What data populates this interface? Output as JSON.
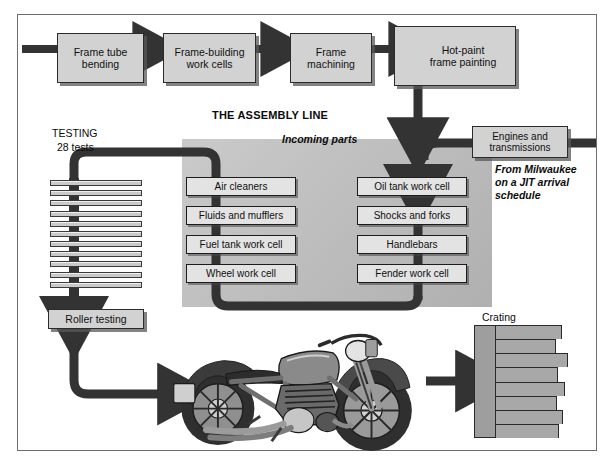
{
  "diagram": {
    "title_assembly": "THE ASSEMBLY LINE",
    "frame_line_boxes": [
      {
        "id": "frame-tube-bending",
        "label": "Frame tube\nbending"
      },
      {
        "id": "frame-building",
        "label": "Frame-building\nwork cells"
      },
      {
        "id": "frame-machining",
        "label": "Frame\nmachining"
      },
      {
        "id": "hot-paint",
        "label": "Hot-paint\nframe painting"
      }
    ],
    "testing": {
      "heading": "TESTING",
      "count_label": "28 tests",
      "slat_count": 11,
      "roller_box": "Roller testing"
    },
    "incoming_parts_label": "Incoming parts",
    "left_cells": [
      "Air cleaners",
      "Fluids and mufflers",
      "Fuel tank work cell",
      "Wheel work cell"
    ],
    "right_cells": [
      "Oil tank work cell",
      "Shocks and forks",
      "Handlebars",
      "Fender work cell"
    ],
    "engines": {
      "box_label": "Engines and\ntransmissions",
      "note": "From Milwaukee\non a JIT arrival\nschedule"
    },
    "crating": {
      "label": "Crating",
      "row_count": 8
    },
    "motorcycle_alt": "motorcycle-illustration",
    "colors": {
      "box_fill": "#d2d2d2",
      "cell_fill": "#e3e3e3",
      "panel_fill": "#bdbdbd",
      "arrow": "#333333",
      "border": "#2b2b2b",
      "crate": "#a8a8a8"
    }
  }
}
